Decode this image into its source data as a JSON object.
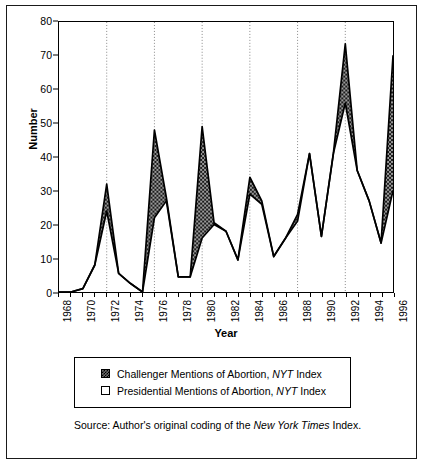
{
  "figure": {
    "ylabel": "Number",
    "xlabel": "Year"
  },
  "legend": {
    "items": [
      {
        "swatch": "filled-square",
        "label_pre": "Challenger Mentions of Abortion, ",
        "label_em": "NYT",
        "label_post": " Index"
      },
      {
        "swatch": "hollow-square",
        "label_pre": "Presidential Mentions of Abortion, ",
        "label_em": "NYT",
        "label_post": " Index"
      }
    ]
  },
  "source": {
    "pre": "Source: Author's original coding of the ",
    "em": "New York Times",
    "post": " Index."
  },
  "chart_data": {
    "type": "area",
    "title": "",
    "xlabel": "Year",
    "ylabel": "Number",
    "xlim": [
      1968,
      1996
    ],
    "ylim": [
      0,
      80
    ],
    "yticks": [
      0,
      10,
      20,
      30,
      40,
      50,
      60,
      70,
      80
    ],
    "xticks": [
      1968,
      1969,
      1970,
      1971,
      1972,
      1973,
      1974,
      1975,
      1976,
      1977,
      1978,
      1979,
      1980,
      1981,
      1982,
      1983,
      1984,
      1985,
      1986,
      1987,
      1988,
      1989,
      1990,
      1991,
      1992,
      1993,
      1994,
      1995,
      1996
    ],
    "xtick_labels": [
      1968,
      1970,
      1972,
      1974,
      1976,
      1978,
      1980,
      1982,
      1984,
      1986,
      1988,
      1990,
      1992,
      1994,
      1996
    ],
    "grid": "vertical dotted gridlines at presidential election years",
    "gridlines_x": [
      1972,
      1976,
      1980,
      1984,
      1988,
      1992
    ],
    "legend_position": "below plot",
    "fill_between": "shaded (hatched grey) between Challenger and Presidential series",
    "x": [
      1968,
      1969,
      1970,
      1971,
      1972,
      1973,
      1974,
      1975,
      1976,
      1977,
      1978,
      1979,
      1980,
      1981,
      1982,
      1983,
      1984,
      1985,
      1986,
      1987,
      1988,
      1989,
      1990,
      1991,
      1992,
      1993,
      1994,
      1995,
      1996
    ],
    "series": [
      {
        "name": "Challenger Mentions of Abortion, NYT Index",
        "values": [
          0,
          0,
          1,
          8,
          32,
          5.5,
          2.5,
          0,
          48,
          28,
          4.5,
          4.5,
          49,
          20.5,
          18,
          9.5,
          34,
          27,
          10.5,
          16,
          23,
          41,
          16.5,
          41,
          73.5,
          36,
          27,
          14.5,
          70
        ]
      },
      {
        "name": "Presidential Mentions of Abortion, NYT Index",
        "values": [
          0,
          0,
          1,
          8,
          24,
          5.5,
          2.5,
          0,
          22,
          27,
          4.5,
          4.5,
          16,
          20,
          18,
          9.5,
          29,
          26,
          10.5,
          16,
          21,
          41,
          16.5,
          41,
          56,
          36,
          27,
          14.5,
          30
        ]
      }
    ]
  }
}
